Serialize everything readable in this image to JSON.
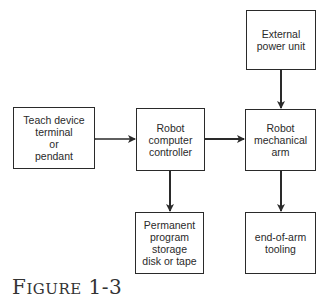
{
  "diagram": {
    "nodes": [
      {
        "id": "power",
        "label": "External\npower unit"
      },
      {
        "id": "teach",
        "label": "Teach device\nterminal\nor\npendant"
      },
      {
        "id": "controller",
        "label": "Robot\ncomputer\ncontroller"
      },
      {
        "id": "arm",
        "label": "Robot\nmechanical\narm"
      },
      {
        "id": "storage",
        "label": "Permanent\nprogram\nstorage\ndisk or tape"
      },
      {
        "id": "tooling",
        "label": "end-of-arm\ntooling"
      }
    ],
    "edges": [
      {
        "from": "power",
        "to": "arm",
        "direction": "one-way"
      },
      {
        "from": "teach",
        "to": "controller",
        "direction": "two-way"
      },
      {
        "from": "controller",
        "to": "arm",
        "direction": "two-way"
      },
      {
        "from": "controller",
        "to": "storage",
        "direction": "two-way"
      },
      {
        "from": "arm",
        "to": "tooling",
        "direction": "two-way"
      }
    ]
  },
  "caption": {
    "first": "F",
    "rest": "IGURE",
    "number": " 1-3"
  }
}
